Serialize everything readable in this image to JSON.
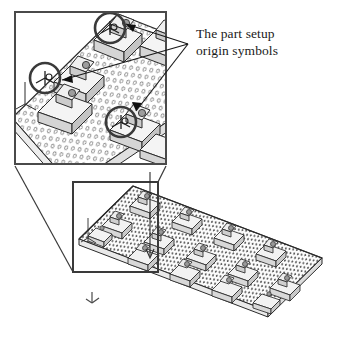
{
  "figure": {
    "type": "engineering-illustration",
    "background_color": "#ffffff",
    "line_color": "#2b2b2b",
    "annotation": {
      "text": "The part setup\norigin symbols",
      "line1": "The part setup",
      "line2": "origin symbols",
      "color": "#1a1a1a"
    },
    "caption": {
      "text": ""
    },
    "detail_box": {
      "label": "magnified-detail-view",
      "x": 14,
      "y": 11,
      "width": 153,
      "height": 154,
      "border_color": "#4a4a4a"
    },
    "zoom_region_box": {
      "label": "zoom-source-region",
      "x": 73,
      "y": 182,
      "width": 85,
      "height": 90,
      "border_color": "#3a3a3a"
    },
    "origin_symbols": [
      {
        "id": "origin-symbol-top",
        "cx": 110,
        "cy": 28,
        "r": 15
      },
      {
        "id": "origin-symbol-left",
        "cx": 45,
        "cy": 78,
        "r": 15
      },
      {
        "id": "origin-symbol-bottom",
        "cx": 121,
        "cy": 122,
        "r": 15
      }
    ],
    "leader_lines": {
      "origin_x": 188,
      "origin_y": 44,
      "targets": [
        {
          "x": 126,
          "y": 24
        },
        {
          "x": 62,
          "y": 80
        },
        {
          "x": 135,
          "y": 110
        }
      ]
    },
    "plate": {
      "label": "fixture-plate",
      "hole_pattern": "dotted-grid",
      "fill_color": "#fbfbfb",
      "edge_color": "#2b2b2b"
    },
    "axis_marker": {
      "label": "coordinate-axis-marker",
      "x": 92,
      "y": 300
    },
    "clamp_count": 14
  }
}
